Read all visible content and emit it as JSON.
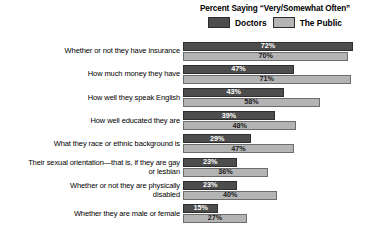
{
  "legend": {
    "title": "Percent Saying “Very/Somewhat Often”",
    "items": [
      {
        "label": "Doctors",
        "color": "#4d4d4d"
      },
      {
        "label": "The Public",
        "color": "#b4b4b4"
      }
    ]
  },
  "chart_data": {
    "type": "bar",
    "orientation": "horizontal",
    "title": "Percent Saying “Very/Somewhat Often”",
    "xlabel": "",
    "ylabel": "",
    "xlim": [
      0,
      80
    ],
    "grid": false,
    "legend_position": "top-right",
    "value_suffix": "%",
    "categories": [
      "Whether or not they have insurance",
      "How much money they have",
      "How well they speak English",
      "How well educated they are",
      "What they race or ethnic background is",
      "Their sexual orientation—that is, if they are gay or lesbian",
      "Whether or not they are physically disabled",
      "Whether they are male or female"
    ],
    "series": [
      {
        "name": "Doctors",
        "color": "#4d4d4d",
        "values": [
          72,
          47,
          43,
          39,
          29,
          23,
          23,
          15
        ],
        "labels": [
          "72%",
          "47%",
          "43%",
          "39%",
          "29%",
          "23%",
          "23%",
          "15%"
        ]
      },
      {
        "name": "The Public",
        "color": "#b4b4b4",
        "values": [
          70,
          71,
          58,
          48,
          47,
          36,
          40,
          27
        ],
        "labels": [
          "70%",
          "71%",
          "58%",
          "48%",
          "47%",
          "36%",
          "40%",
          "27%"
        ]
      }
    ]
  },
  "rows": [
    {
      "label_lines": [
        "Whether or not they have insurance"
      ],
      "doctors": {
        "value": 72,
        "label": "72%"
      },
      "public": {
        "value": 70,
        "label": "70%"
      }
    },
    {
      "label_lines": [
        "How much money they have"
      ],
      "doctors": {
        "value": 47,
        "label": "47%"
      },
      "public": {
        "value": 71,
        "label": "71%"
      }
    },
    {
      "label_lines": [
        "How well they speak English"
      ],
      "doctors": {
        "value": 43,
        "label": "43%"
      },
      "public": {
        "value": 58,
        "label": "58%"
      }
    },
    {
      "label_lines": [
        "How well educated they are"
      ],
      "doctors": {
        "value": 39,
        "label": "39%"
      },
      "public": {
        "value": 48,
        "label": "48%"
      }
    },
    {
      "label_lines": [
        "What they race or ethnic background is"
      ],
      "doctors": {
        "value": 29,
        "label": "29%"
      },
      "public": {
        "value": 47,
        "label": "47%"
      }
    },
    {
      "label_lines": [
        "Their sexual orientation—that is, if they are gay",
        "or lesbian"
      ],
      "doctors": {
        "value": 23,
        "label": "23%"
      },
      "public": {
        "value": 36,
        "label": "36%"
      }
    },
    {
      "label_lines": [
        "Whether or not they are physically",
        "disabled"
      ],
      "doctors": {
        "value": 23,
        "label": "23%"
      },
      "public": {
        "value": 40,
        "label": "40%"
      }
    },
    {
      "label_lines": [
        "Whether they are male or female"
      ],
      "doctors": {
        "value": 15,
        "label": "15%"
      },
      "public": {
        "value": 27,
        "label": "27%"
      }
    }
  ],
  "scale": {
    "px_per_percent": 2.36
  }
}
